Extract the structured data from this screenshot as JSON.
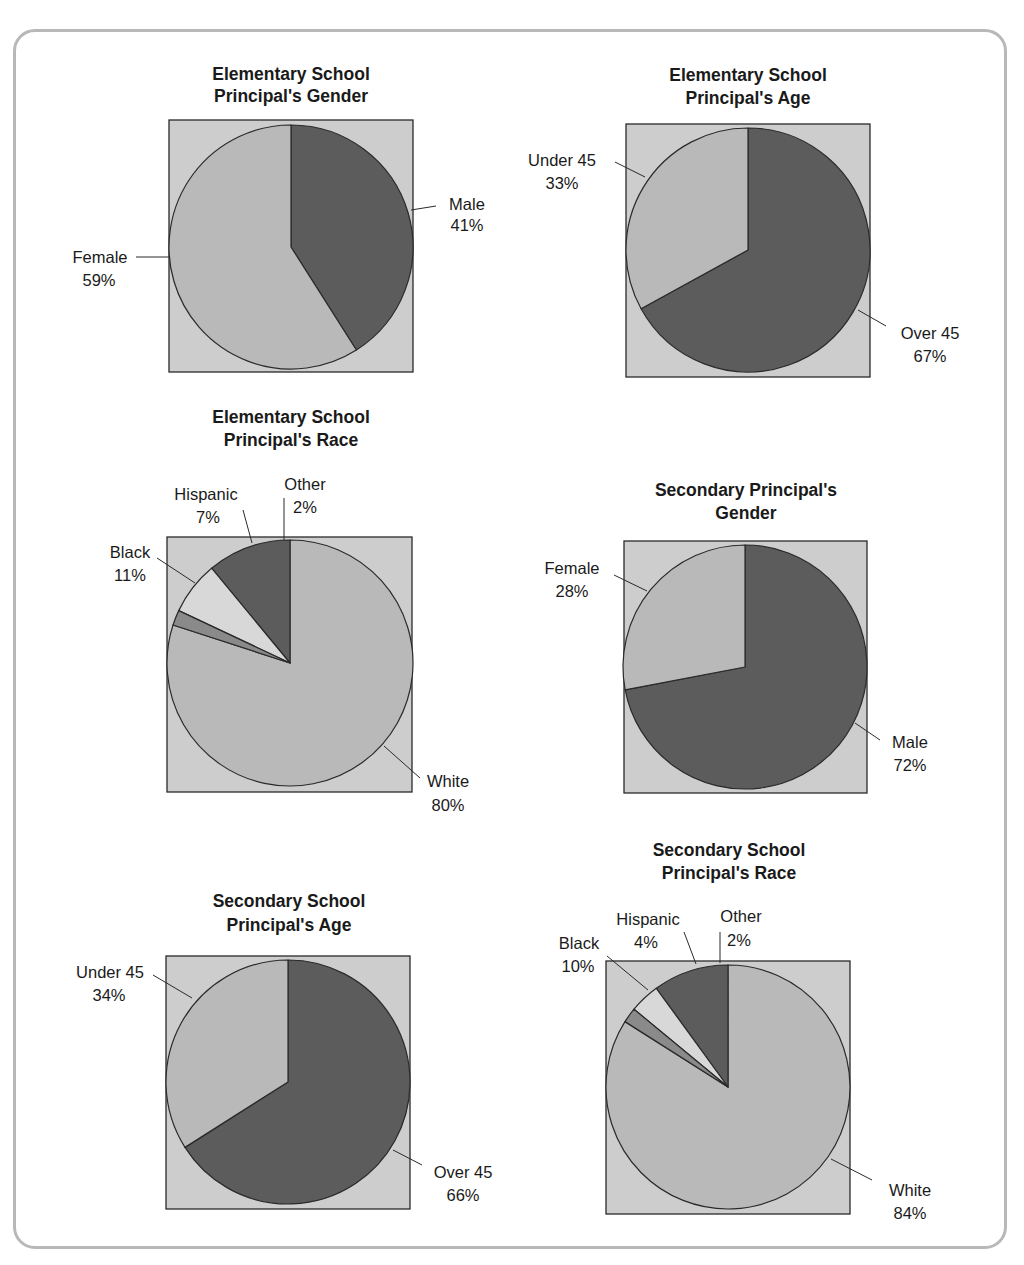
{
  "colors": {
    "dark": "#5c5c5c",
    "light": "#b9b9b9",
    "lighter": "#d8d8d8",
    "mid": "#8a8a8a",
    "box": "#cdcdcd",
    "stroke": "#2a2a2a"
  },
  "chart_data": [
    {
      "type": "pie",
      "title": "Elementary School Principal's Gender",
      "title_lines": [
        "Elementary School",
        "Principal's Gender"
      ],
      "categories": [
        "Male",
        "Female"
      ],
      "values": [
        41,
        59
      ],
      "labels": [
        {
          "name": "Male",
          "value": "41%"
        },
        {
          "name": "Female",
          "value": "59%"
        }
      ]
    },
    {
      "type": "pie",
      "title": "Elementary School Principal's Age",
      "title_lines": [
        "Elementary School",
        "Principal's Age"
      ],
      "categories": [
        "Over 45",
        "Under 45"
      ],
      "values": [
        67,
        33
      ],
      "labels": [
        {
          "name": "Over 45",
          "value": "67%"
        },
        {
          "name": "Under 45",
          "value": "33%"
        }
      ]
    },
    {
      "type": "pie",
      "title": "Elementary School Principal's Race",
      "title_lines": [
        "Elementary School",
        "Principal's Race"
      ],
      "categories": [
        "White",
        "Black",
        "Hispanic",
        "Other"
      ],
      "values": [
        80,
        11,
        7,
        2
      ],
      "labels": [
        {
          "name": "White",
          "value": "80%"
        },
        {
          "name": "Black",
          "value": "11%"
        },
        {
          "name": "Hispanic",
          "value": "7%"
        },
        {
          "name": "Other",
          "value": "2%"
        }
      ]
    },
    {
      "type": "pie",
      "title": "Secondary Principal's Gender",
      "title_lines": [
        "Secondary Principal's",
        "Gender"
      ],
      "categories": [
        "Male",
        "Female"
      ],
      "values": [
        72,
        28
      ],
      "labels": [
        {
          "name": "Male",
          "value": "72%"
        },
        {
          "name": "Female",
          "value": "28%"
        }
      ]
    },
    {
      "type": "pie",
      "title": "Secondary School Principal's Age",
      "title_lines": [
        "Secondary School",
        "Principal's Age"
      ],
      "categories": [
        "Over 45",
        "Under 45"
      ],
      "values": [
        66,
        34
      ],
      "labels": [
        {
          "name": "Over 45",
          "value": "66%"
        },
        {
          "name": "Under 45",
          "value": "34%"
        }
      ]
    },
    {
      "type": "pie",
      "title": "Secondary School Principal's Race",
      "title_lines": [
        "Secondary School",
        "Principal's Race"
      ],
      "categories": [
        "White",
        "Black",
        "Hispanic",
        "Other"
      ],
      "values": [
        84,
        10,
        4,
        2
      ],
      "labels": [
        {
          "name": "White",
          "value": "84%"
        },
        {
          "name": "Black",
          "value": "10%"
        },
        {
          "name": "Hispanic",
          "value": "4%"
        },
        {
          "name": "Other",
          "value": "2%"
        }
      ]
    }
  ]
}
